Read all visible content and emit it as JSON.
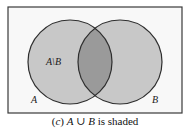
{
  "diagram": {
    "type": "venn",
    "universe": {
      "label": "",
      "x": 8,
      "y": 7,
      "width": 174,
      "height": 106,
      "fill": "#f8f8f8",
      "stroke": "#3a3a3a"
    },
    "sets": [
      {
        "name": "A",
        "label": "A",
        "cx": 70,
        "cy": 62,
        "r": 42,
        "fill": "#c8c8c8",
        "stroke": "#2e2e2e",
        "label_x": 31,
        "label_y": 103
      },
      {
        "name": "B",
        "label": "B",
        "cx": 120,
        "cy": 62,
        "r": 42,
        "fill": "#c8c8c8",
        "stroke": "#2e2e2e",
        "label_x": 152,
        "label_y": 103
      }
    ],
    "intersection": {
      "fill": "#9a9a9a"
    },
    "region_labels": [
      {
        "text": "A\\B",
        "x": 46,
        "y": 65
      }
    ]
  },
  "caption": {
    "prefix_open": "(",
    "prefix_letter": "c",
    "prefix_close": ")",
    "set_a": "A",
    "operator": " ∪ ",
    "set_b": "B",
    "suffix": " is shaded"
  }
}
